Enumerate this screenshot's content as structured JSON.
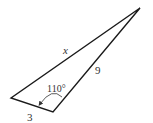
{
  "diagram": {
    "type": "triangle",
    "vertices": {
      "top": [
        140,
        8
      ],
      "left": [
        11,
        98
      ],
      "bottom": [
        53,
        112
      ]
    },
    "labels": {
      "side_long": "x",
      "side_right": "9",
      "side_bottom": "3",
      "angle": "110°"
    },
    "colors": {
      "stroke": "#1a1a1a",
      "text": "#333333"
    }
  }
}
